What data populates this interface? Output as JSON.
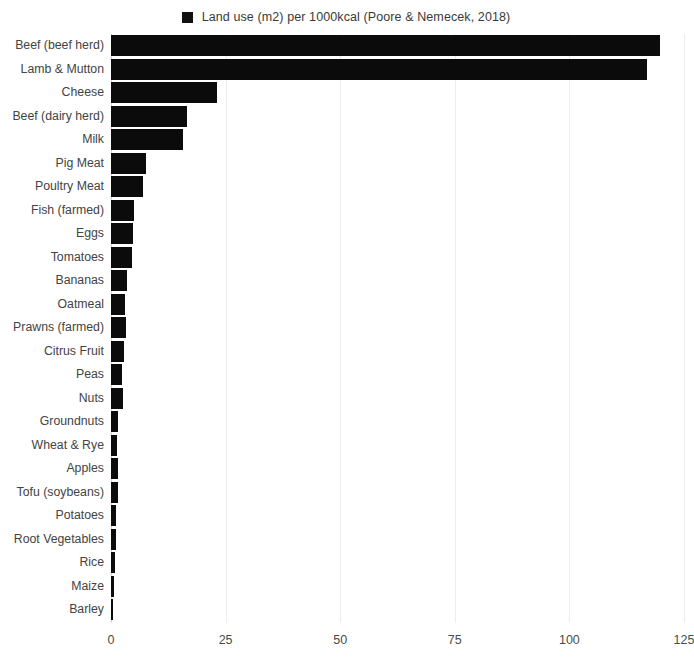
{
  "legend": {
    "swatch_color": "#111111",
    "label": "Land use (m2) per 1000kcal (Poore & Nemecek, 2018)"
  },
  "axis": {
    "x_ticks": [
      "0",
      "25",
      "50",
      "75",
      "100",
      "125"
    ]
  },
  "chart_data": {
    "type": "bar",
    "orientation": "horizontal",
    "title": "",
    "subtitle": "",
    "xlabel": "",
    "ylabel": "",
    "xlim": [
      0,
      125
    ],
    "xticks": [
      0,
      25,
      50,
      75,
      100,
      125
    ],
    "grid": true,
    "legend_position": "top-center",
    "series": [
      {
        "name": "Land use (m2) per 1000kcal (Poore & Nemecek, 2018)",
        "color": "#0b0b0b",
        "values": [
          119.8,
          117.0,
          23.1,
          16.6,
          15.7,
          7.6,
          7.0,
          5.0,
          4.7,
          4.6,
          3.5,
          3.1,
          3.3,
          2.8,
          2.4,
          2.6,
          1.6,
          1.4,
          1.6,
          1.5,
          1.1,
          1.1,
          0.9,
          0.7,
          0.5
        ]
      }
    ],
    "categories": [
      "Beef (beef herd)",
      "Lamb & Mutton",
      "Cheese",
      "Beef (dairy herd)",
      "Milk",
      "Pig Meat",
      "Poultry Meat",
      "Fish (farmed)",
      "Eggs",
      "Tomatoes",
      "Bananas",
      "Oatmeal",
      "Prawns (farmed)",
      "Citrus Fruit",
      "Peas",
      "Nuts",
      "Groundnuts",
      "Wheat & Rye",
      "Apples",
      "Tofu (soybeans)",
      "Potatoes",
      "Root Vegetables",
      "Rice",
      "Maize",
      "Barley"
    ],
    "bars": [
      {
        "category": "Beef (beef herd)",
        "value": 119.8
      },
      {
        "category": "Lamb & Mutton",
        "value": 117.0
      },
      {
        "category": "Cheese",
        "value": 23.1
      },
      {
        "category": "Beef (dairy herd)",
        "value": 16.6
      },
      {
        "category": "Milk",
        "value": 15.7
      },
      {
        "category": "Pig Meat",
        "value": 7.6
      },
      {
        "category": "Poultry Meat",
        "value": 7.0
      },
      {
        "category": "Fish (farmed)",
        "value": 5.0
      },
      {
        "category": "Eggs",
        "value": 4.7
      },
      {
        "category": "Tomatoes",
        "value": 4.6
      },
      {
        "category": "Bananas",
        "value": 3.5
      },
      {
        "category": "Oatmeal",
        "value": 3.1
      },
      {
        "category": "Prawns (farmed)",
        "value": 3.3
      },
      {
        "category": "Citrus Fruit",
        "value": 2.8
      },
      {
        "category": "Peas",
        "value": 2.4
      },
      {
        "category": "Nuts",
        "value": 2.6
      },
      {
        "category": "Groundnuts",
        "value": 1.6
      },
      {
        "category": "Wheat & Rye",
        "value": 1.4
      },
      {
        "category": "Apples",
        "value": 1.6
      },
      {
        "category": "Tofu (soybeans)",
        "value": 1.5
      },
      {
        "category": "Potatoes",
        "value": 1.1
      },
      {
        "category": "Root Vegetables",
        "value": 1.1
      },
      {
        "category": "Rice",
        "value": 0.9
      },
      {
        "category": "Maize",
        "value": 0.7
      },
      {
        "category": "Barley",
        "value": 0.5
      }
    ]
  }
}
